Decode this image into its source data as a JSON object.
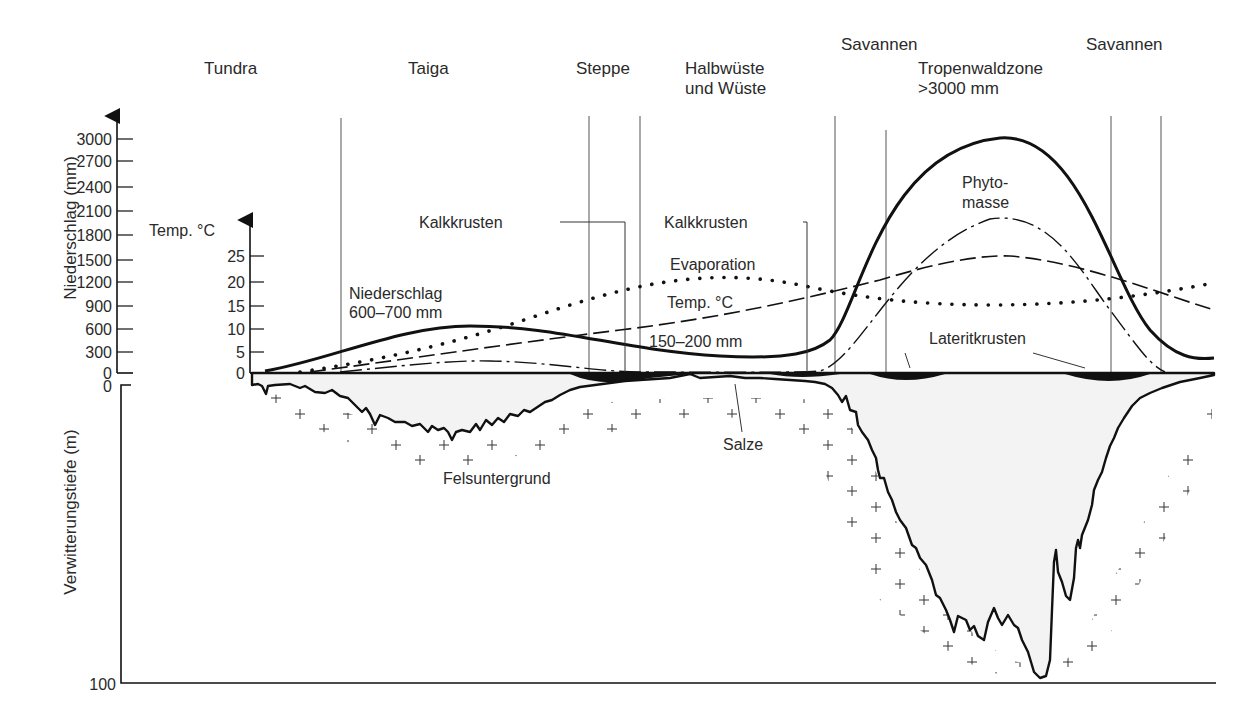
{
  "zones": [
    {
      "name": "tundra",
      "lines": [
        "Tundra"
      ],
      "x": 204,
      "y": 74
    },
    {
      "name": "taiga",
      "lines": [
        "Taiga"
      ],
      "x": 408,
      "y": 74
    },
    {
      "name": "steppe",
      "lines": [
        "Steppe"
      ],
      "x": 576,
      "y": 74
    },
    {
      "name": "halbwueste",
      "lines": [
        "Halbwüste",
        "und Wüste"
      ],
      "x": 685,
      "y": 74
    },
    {
      "name": "savannen-left",
      "lines": [
        "Savannen"
      ],
      "x": 841,
      "y": 50
    },
    {
      "name": "tropenwaldzone",
      "lines": [
        "Tropenwaldzone",
        ">3000 mm"
      ],
      "x": 918,
      "y": 74
    },
    {
      "name": "savannen-right",
      "lines": [
        "Savannen"
      ],
      "x": 1086,
      "y": 50
    }
  ],
  "axes": {
    "precipitation": {
      "label": "Niederschlag (mm)",
      "ticks": [
        "3000",
        "2700",
        "2400",
        "2100",
        "1800",
        "1500",
        "1200",
        "900",
        "600",
        "300",
        "0"
      ]
    },
    "temperature": {
      "label": "Temp. °C",
      "ticks": [
        "25",
        "20",
        "15",
        "10",
        "5",
        "0"
      ]
    },
    "depth": {
      "label": "Verwitterungstiefe (m)",
      "ticks": [
        "0",
        "100"
      ]
    }
  },
  "annotations": {
    "kalkkrusten_1": "Kalkkrusten",
    "kalkkrusten_2": "Kalkkrusten",
    "evaporation": "Evaporation",
    "temp_curve": "Temp. °C",
    "niederschlag_1": "Niederschlag",
    "niederschlag_2": "600–700 mm",
    "dry_precip": "150–200 mm",
    "phyto_1": "Phyto-",
    "phyto_2": "masse",
    "lateritkrusten": "Lateritkrusten",
    "salze": "Salze",
    "felsuntergrund": "Felsuntergrund"
  },
  "colors": {
    "line": "#111111",
    "thin_line": "#444444",
    "regolith_fill": "#f4f4f4",
    "text": "#2a2a2a"
  }
}
